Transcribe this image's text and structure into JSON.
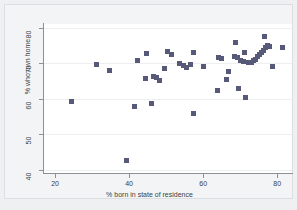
{
  "chart_data": {
    "type": "scatter",
    "title": "",
    "xlabel": "% born in state of residence",
    "ylabel": "% who own home",
    "xlim": [
      17,
      84
    ],
    "ylim": [
      39,
      81
    ],
    "xticks": [
      20,
      40,
      60,
      80
    ],
    "yticks": [
      40,
      50,
      60,
      70,
      80
    ],
    "grid": "horizontal-light",
    "legend": "none",
    "marker_color": "#565a78",
    "marker_shape": "square",
    "background_color": "#ffffff",
    "figure_background_color": "#f3f4f5",
    "axis_color": "#8d9196",
    "points": [
      {
        "x": 24.3,
        "y": 59.2
      },
      {
        "x": 31.2,
        "y": 69.5
      },
      {
        "x": 34.8,
        "y": 67.8
      },
      {
        "x": 39.2,
        "y": 42.5
      },
      {
        "x": 41.5,
        "y": 57.9
      },
      {
        "x": 42.2,
        "y": 70.8
      },
      {
        "x": 44.3,
        "y": 65.7
      },
      {
        "x": 44.8,
        "y": 72.6
      },
      {
        "x": 45.9,
        "y": 58.5
      },
      {
        "x": 46.6,
        "y": 66.1
      },
      {
        "x": 47.4,
        "y": 66.0
      },
      {
        "x": 48.3,
        "y": 65.2
      },
      {
        "x": 49.6,
        "y": 68.6
      },
      {
        "x": 50.4,
        "y": 73.4
      },
      {
        "x": 51.3,
        "y": 72.3
      },
      {
        "x": 53.6,
        "y": 69.8
      },
      {
        "x": 54.7,
        "y": 69.2
      },
      {
        "x": 55.6,
        "y": 68.7
      },
      {
        "x": 56.6,
        "y": 69.6
      },
      {
        "x": 57.3,
        "y": 55.8
      },
      {
        "x": 57.5,
        "y": 73.1
      },
      {
        "x": 60.1,
        "y": 68.9
      },
      {
        "x": 63.8,
        "y": 62.2
      },
      {
        "x": 64.2,
        "y": 71.6
      },
      {
        "x": 64.9,
        "y": 71.2
      },
      {
        "x": 66.4,
        "y": 65.4
      },
      {
        "x": 66.9,
        "y": 67.7
      },
      {
        "x": 68.4,
        "y": 71.9
      },
      {
        "x": 68.8,
        "y": 75.9
      },
      {
        "x": 69.2,
        "y": 71.5
      },
      {
        "x": 69.6,
        "y": 62.9
      },
      {
        "x": 70.1,
        "y": 70.8
      },
      {
        "x": 70.8,
        "y": 70.4
      },
      {
        "x": 71.2,
        "y": 72.9
      },
      {
        "x": 71.4,
        "y": 60.2
      },
      {
        "x": 72.1,
        "y": 70.1
      },
      {
        "x": 73.0,
        "y": 70.2
      },
      {
        "x": 73.6,
        "y": 70.6
      },
      {
        "x": 74.2,
        "y": 71.1
      },
      {
        "x": 74.8,
        "y": 71.8
      },
      {
        "x": 75.3,
        "y": 72.4
      },
      {
        "x": 75.8,
        "y": 73.0
      },
      {
        "x": 76.3,
        "y": 73.6
      },
      {
        "x": 76.6,
        "y": 77.4
      },
      {
        "x": 76.9,
        "y": 74.3
      },
      {
        "x": 77.4,
        "y": 74.9
      },
      {
        "x": 77.9,
        "y": 74.6
      },
      {
        "x": 78.6,
        "y": 68.9
      },
      {
        "x": 81.3,
        "y": 74.4
      }
    ]
  }
}
